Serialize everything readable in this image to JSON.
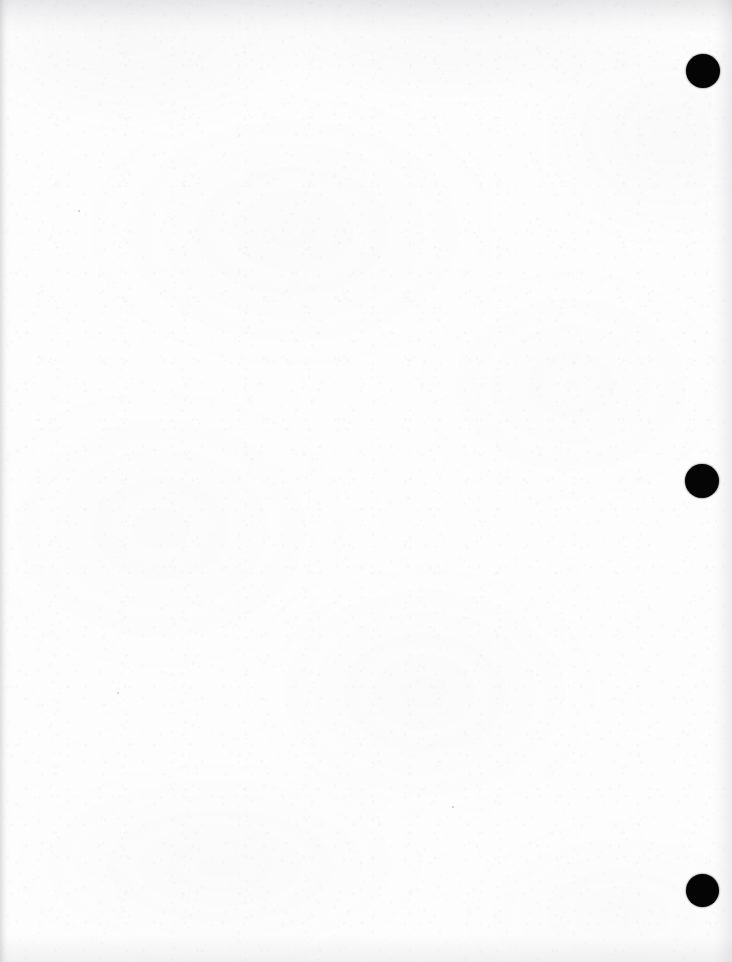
{
  "page": {
    "kind": "scanned-blank-page",
    "width": 732,
    "height": 962,
    "background_color": "#fdfdfd",
    "content_text": "",
    "description": "Blank scanned document page with three solid black margin marks along the right edge"
  },
  "margin_marks": {
    "color": "#050505",
    "count": 3,
    "items": [
      {
        "name": "margin-mark-top",
        "cx": 703,
        "cy": 71,
        "diameter": 34,
        "label": "1"
      },
      {
        "name": "margin-mark-middle",
        "cx": 702,
        "cy": 481,
        "diameter": 34,
        "label": "2"
      },
      {
        "name": "margin-mark-bottom",
        "cx": 702,
        "cy": 890,
        "diameter": 33,
        "label": "3"
      }
    ]
  },
  "specks": [
    {
      "x": 117,
      "y": 692,
      "size": 2
    },
    {
      "x": 78,
      "y": 210,
      "size": 2
    },
    {
      "x": 452,
      "y": 806,
      "size": 2
    }
  ],
  "edges": {
    "left_shadow_color": "#96969e",
    "top_shadow_color": "#9898a0",
    "right_shadow_color": "#96969e",
    "bottom_shadow_color": "#9898a0"
  }
}
